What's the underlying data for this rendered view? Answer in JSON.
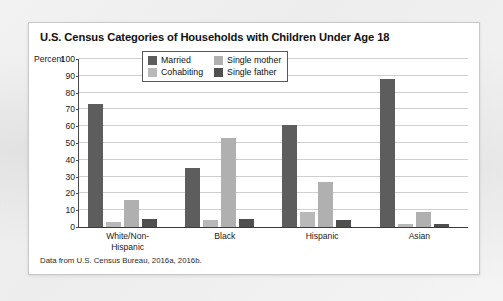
{
  "figure": {
    "title": "U.S. Census Categories of Households with Children Under Age 18",
    "source_note": "Data from U.S. Census Bureau, 2016a, 2016b.",
    "axis_prefix_label": "Percent"
  },
  "colors": {
    "married": "#5d5d5d",
    "cohabiting": "#b9b9b9",
    "single_mother": "#b0b0b0",
    "single_father": "#4f4f4f",
    "gridline": "#cfcfcf",
    "axis": "#3a3a3a",
    "card_background": "#ffffff",
    "page_background": "#f0f0f0"
  },
  "chart_data": {
    "type": "bar",
    "title": "U.S. Census Categories of Households with Children Under Age 18",
    "xlabel": "",
    "ylabel": "Percent",
    "ylim": [
      0,
      100
    ],
    "yticks": [
      0,
      10,
      20,
      30,
      40,
      50,
      60,
      70,
      80,
      90,
      100
    ],
    "ytick_labels": [
      "0",
      "10",
      "20",
      "30",
      "40",
      "50",
      "60",
      "70",
      "80",
      "90",
      "100"
    ],
    "grid": true,
    "legend_position": "upper-center",
    "categories": [
      "White/Non-Hispanic",
      "Black",
      "Hispanic",
      "Asian"
    ],
    "category_lines": [
      [
        "White/Non-",
        "Hispanic"
      ],
      [
        "Black"
      ],
      [
        "Hispanic"
      ],
      [
        "Asian"
      ]
    ],
    "series": [
      {
        "name": "Married",
        "color": "#5d5d5d",
        "values": [
          73,
          35,
          61,
          88
        ]
      },
      {
        "name": "Cohabiting",
        "color": "#b9b9b9",
        "values": [
          3,
          4,
          9,
          2
        ]
      },
      {
        "name": "Single mother",
        "color": "#b0b0b0",
        "values": [
          16,
          53,
          27,
          9
        ]
      },
      {
        "name": "Single father",
        "color": "#4f4f4f",
        "values": [
          5,
          5,
          4,
          2
        ]
      }
    ]
  }
}
